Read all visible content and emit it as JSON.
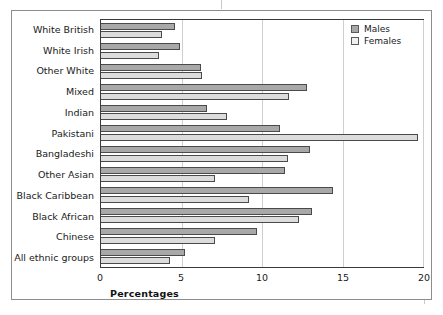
{
  "chart_data": {
    "type": "bar",
    "orientation": "horizontal",
    "title": "",
    "xlabel": "Percentages",
    "ylabel": "",
    "xlim": [
      0,
      20
    ],
    "xticks": [
      0,
      5,
      10,
      15,
      20
    ],
    "grid": true,
    "legend_position": "top-right",
    "categories": [
      "White British",
      "White Irish",
      "Other White",
      "Mixed",
      "Indian",
      "Pakistani",
      "Bangladeshi",
      "Other Asian",
      "Black Caribbean",
      "Black African",
      "Chinese",
      "All ethnic groups"
    ],
    "series": [
      {
        "name": "Males",
        "color": "#a8a8a8",
        "values": [
          4.6,
          4.9,
          6.2,
          12.8,
          6.6,
          11.1,
          13.0,
          11.4,
          14.4,
          13.1,
          9.7,
          5.2
        ]
      },
      {
        "name": "Females",
        "color": "#dcdcdc",
        "values": [
          3.8,
          3.6,
          6.3,
          11.7,
          7.8,
          19.7,
          11.6,
          7.1,
          9.2,
          12.3,
          7.1,
          4.3
        ]
      }
    ]
  },
  "legend": {
    "items": [
      {
        "label": "Males",
        "swatch": "males-swatch"
      },
      {
        "label": "Females",
        "swatch": "females-swatch"
      }
    ]
  },
  "axis": {
    "x_title": "Percentages",
    "tick_labels": [
      "0",
      "5",
      "10",
      "15",
      "20"
    ]
  }
}
